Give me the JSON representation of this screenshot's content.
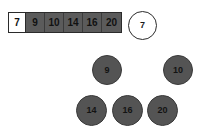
{
  "canvas": {
    "width": 207,
    "height": 130,
    "background": "#ffffff"
  },
  "colors": {
    "node_fill_dark": "#545454",
    "node_fill_light": "#ffffff",
    "node_border": "#2b2b2b",
    "array_cell_filled": "#5b5b5b",
    "array_cell_empty": "#ffffff",
    "text": "#131313"
  },
  "array_strip": {
    "name": "sorted-array-strip",
    "cells": [
      {
        "value": "7",
        "state": "empty"
      },
      {
        "value": "9",
        "state": "filled"
      },
      {
        "value": "10",
        "state": "filled"
      },
      {
        "value": "14",
        "state": "filled"
      },
      {
        "value": "16",
        "state": "filled"
      },
      {
        "value": "20",
        "state": "filled"
      }
    ]
  },
  "nodes": [
    {
      "label": "7",
      "style": "light",
      "x": 128,
      "y": 11,
      "size": 29
    },
    {
      "label": "9",
      "style": "dark",
      "x": 92,
      "y": 55,
      "size": 30
    },
    {
      "label": "10",
      "style": "dark",
      "x": 163,
      "y": 55,
      "size": 30
    },
    {
      "label": "14",
      "style": "dark",
      "x": 76,
      "y": 95,
      "size": 31
    },
    {
      "label": "16",
      "style": "dark",
      "x": 112,
      "y": 95,
      "size": 31
    },
    {
      "label": "20",
      "style": "dark",
      "x": 147,
      "y": 95,
      "size": 31
    }
  ]
}
